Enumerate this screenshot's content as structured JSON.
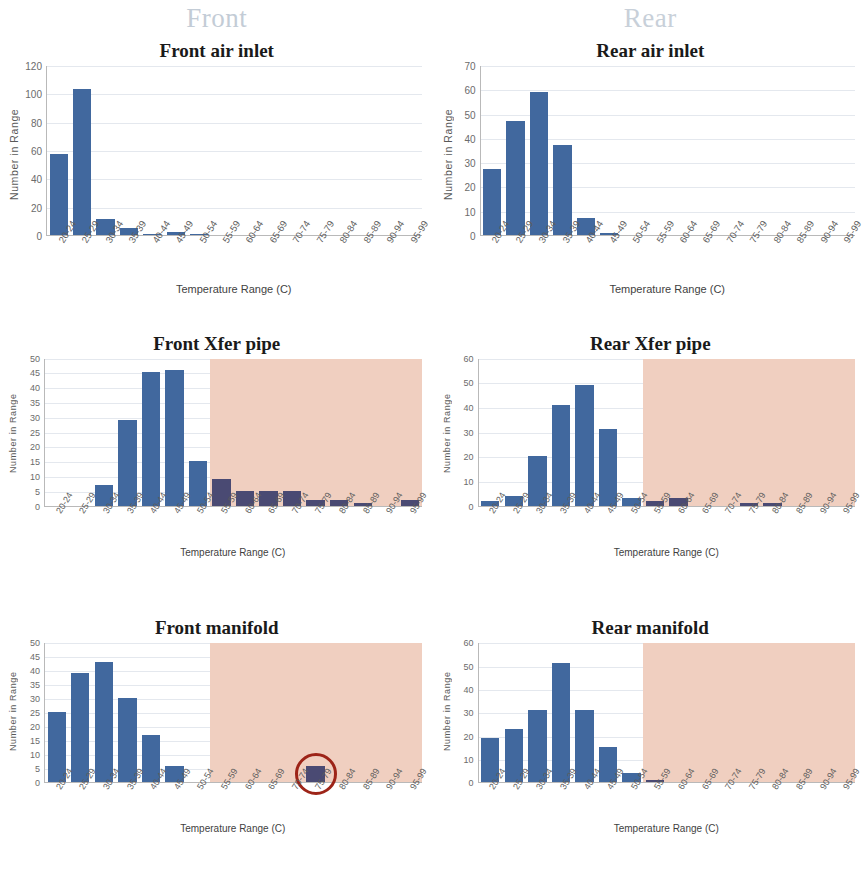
{
  "headers": {
    "left": "Front",
    "right": "Rear"
  },
  "common": {
    "x_axis_title": "Temperature Range (C)",
    "y_axis_title": "Number  in  Range",
    "categories": [
      "20-24",
      "25-29",
      "30-34",
      "35-39",
      "40-44",
      "45-49",
      "50-54",
      "55-59",
      "60-64",
      "65-69",
      "70-74",
      "75-79",
      "80-84",
      "85-89",
      "90-94",
      "95-99"
    ]
  },
  "colors": {
    "bar": "#41689e",
    "bar_hot": "#4a4a73",
    "shade": "#f0cfc0",
    "header_text": "#c3ccd6",
    "annotation": "#9d2418",
    "gridline": "#e4e8ee",
    "axis": "#b9b9b9"
  },
  "chart_data": [
    {
      "id": "front-air-inlet",
      "type": "bar",
      "title": "Front air inlet",
      "xlabel": "Temperature Range (C)",
      "ylabel": "Number  in  Range",
      "categories": [
        "20-24",
        "25-29",
        "30-34",
        "35-39",
        "40-44",
        "45-49",
        "50-54",
        "55-59",
        "60-64",
        "65-69",
        "70-74",
        "75-79",
        "80-84",
        "85-89",
        "90-94",
        "95-99"
      ],
      "values": [
        57,
        103,
        11,
        5,
        1,
        2,
        1,
        0,
        0,
        0,
        0,
        0,
        0,
        0,
        0,
        0
      ],
      "ylim": [
        0,
        120
      ],
      "yticks": [
        0,
        20,
        40,
        60,
        80,
        100,
        120
      ],
      "grid": true,
      "shaded_from_index": null,
      "annotation": null
    },
    {
      "id": "rear-air-inlet",
      "type": "bar",
      "title": "Rear air inlet",
      "xlabel": "Temperature Range (C)",
      "ylabel": "Number  in  Range",
      "categories": [
        "20-24",
        "25-29",
        "30-34",
        "35-39",
        "40-44",
        "45-49",
        "50-54",
        "55-59",
        "60-64",
        "65-69",
        "70-74",
        "75-79",
        "80-84",
        "85-89",
        "90-94",
        "95-99"
      ],
      "values": [
        27,
        47,
        59,
        37,
        7,
        1,
        0,
        0,
        0,
        0,
        0,
        0,
        0,
        0,
        0,
        0
      ],
      "ylim": [
        0,
        70
      ],
      "yticks": [
        0,
        10,
        20,
        30,
        40,
        50,
        60,
        70
      ],
      "grid": true,
      "shaded_from_index": null,
      "annotation": null
    },
    {
      "id": "front-xfer-pipe",
      "type": "bar",
      "title": "Front Xfer pipe",
      "xlabel": "Temperature Range (C)",
      "ylabel": "Number  in  Range",
      "categories": [
        "20-24",
        "25-29",
        "30-34",
        "35-39",
        "40-44",
        "45-49",
        "50-54",
        "55-59",
        "60-64",
        "65-69",
        "70-74",
        "75-79",
        "80-84",
        "85-89",
        "90-94",
        "95-99"
      ],
      "values": [
        0,
        0,
        7,
        29,
        45,
        46,
        15,
        9,
        5,
        5,
        5,
        2,
        2,
        1,
        0,
        2
      ],
      "ylim": [
        0,
        50
      ],
      "yticks": [
        0,
        5,
        10,
        15,
        20,
        25,
        30,
        35,
        40,
        45,
        50
      ],
      "grid": true,
      "shaded_from_index": 7,
      "annotation": null
    },
    {
      "id": "rear-xfer-pipe",
      "type": "bar",
      "title": "Rear Xfer pipe",
      "xlabel": "Temperature Range (C)",
      "ylabel": "Number  in  Range",
      "categories": [
        "20-24",
        "25-29",
        "30-34",
        "35-39",
        "40-44",
        "45-49",
        "50-54",
        "55-59",
        "60-64",
        "65-69",
        "70-74",
        "75-79",
        "80-84",
        "85-89",
        "90-94",
        "95-99"
      ],
      "values": [
        2,
        4,
        20,
        41,
        49,
        31,
        3,
        2,
        3,
        0,
        0,
        1,
        1,
        0,
        0,
        0
      ],
      "ylim": [
        0,
        60
      ],
      "yticks": [
        0,
        10,
        20,
        30,
        40,
        50,
        60
      ],
      "grid": true,
      "shaded_from_index": 7,
      "annotation": null
    },
    {
      "id": "front-manifold",
      "type": "bar",
      "title": "Front manifold",
      "xlabel": "Temperature Range (C)",
      "ylabel": "Number  in  Range",
      "categories": [
        "20-24",
        "25-29",
        "30-34",
        "35-39",
        "40-44",
        "45-49",
        "50-54",
        "55-59",
        "60-64",
        "65-69",
        "70-74",
        "75-79",
        "80-84",
        "85-89",
        "90-94",
        "95-99"
      ],
      "values": [
        25,
        39,
        43,
        30,
        17,
        6,
        0,
        0,
        0,
        0,
        0,
        6,
        0,
        0,
        0,
        0
      ],
      "ylim": [
        0,
        50
      ],
      "yticks": [
        0,
        5,
        10,
        15,
        20,
        25,
        30,
        35,
        40,
        45,
        50
      ],
      "grid": true,
      "shaded_from_index": 7,
      "annotation": {
        "type": "circle",
        "target_index": 11,
        "label": "highlight-circle"
      }
    },
    {
      "id": "rear-manifold",
      "type": "bar",
      "title": "Rear manifold",
      "xlabel": "Temperature Range (C)",
      "ylabel": "Number  in  Range",
      "categories": [
        "20-24",
        "25-29",
        "30-34",
        "35-39",
        "40-44",
        "45-49",
        "50-54",
        "55-59",
        "60-64",
        "65-69",
        "70-74",
        "75-79",
        "80-84",
        "85-89",
        "90-94",
        "95-99"
      ],
      "values": [
        19,
        23,
        31,
        51,
        31,
        15,
        4,
        1,
        0,
        0,
        0,
        0,
        0,
        0,
        0,
        0
      ],
      "ylim": [
        0,
        60
      ],
      "yticks": [
        0,
        10,
        20,
        30,
        40,
        50,
        60
      ],
      "grid": true,
      "shaded_from_index": 7,
      "annotation": null
    }
  ]
}
